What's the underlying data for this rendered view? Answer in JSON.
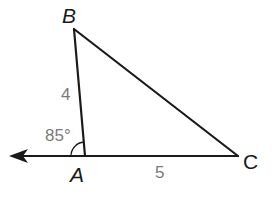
{
  "diagram": {
    "type": "triangle",
    "vertices": [
      {
        "name": "B",
        "x": 74,
        "y": 29
      },
      {
        "name": "A",
        "x": 85,
        "y": 156
      },
      {
        "name": "C",
        "x": 238,
        "y": 156
      }
    ],
    "labels": {
      "vertex_b": "B",
      "vertex_a": "A",
      "vertex_c": "C",
      "side_ab": "4",
      "side_ac": "5",
      "exterior_angle_a": "85°"
    },
    "colors": {
      "line": "#1a1a1a",
      "measure_text": "#7a7a7a",
      "background": "#ffffff"
    }
  }
}
